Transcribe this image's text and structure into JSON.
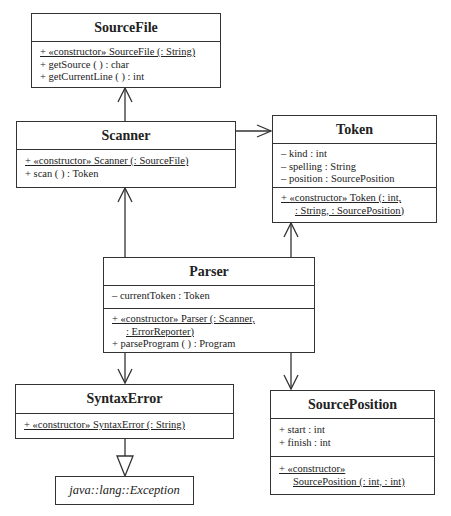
{
  "diagram": {
    "type": "UML class diagram",
    "classes": {
      "sourcefile": {
        "name": "SourceFile",
        "attributes": [],
        "operations": [
          {
            "text": "+ «constructor» SourceFile (: String)",
            "static_underline": true
          },
          {
            "text": "+ getSource ( ) : char",
            "static_underline": false
          },
          {
            "text": "+ getCurrentLine ( ) : int",
            "static_underline": false
          }
        ]
      },
      "scanner": {
        "name": "Scanner",
        "attributes": [],
        "operations": [
          {
            "text": "+ «constructor» Scanner (: SourceFile)",
            "static_underline": true
          },
          {
            "text": "+ scan ( ) : Token",
            "static_underline": false
          }
        ]
      },
      "token": {
        "name": "Token",
        "attributes": [
          {
            "text": "– kind : int"
          },
          {
            "text": "– spelling : String"
          },
          {
            "text": "– position : SourcePosition"
          }
        ],
        "operations": [
          {
            "line1": "+ «constructor» Token (: int,",
            "line2": ": String, : SourcePosition)",
            "static_underline": true
          }
        ]
      },
      "parser": {
        "name": "Parser",
        "attributes": [
          {
            "text": "– currentToken : Token"
          }
        ],
        "operations": [
          {
            "line1": "+ «constructor» Parser (: Scanner,",
            "line2": ": ErrorReporter)",
            "static_underline": true
          },
          {
            "text": "+ parseProgram ( ) : Program",
            "static_underline": false
          }
        ]
      },
      "syntaxerror": {
        "name": "SyntaxError",
        "attributes": [],
        "operations": [
          {
            "text": "+ «constructor» SyntaxError (: String)",
            "static_underline": true
          }
        ]
      },
      "exception": {
        "name": "java::lang::Exception",
        "abstract_italic": true
      },
      "sourceposition": {
        "name": "SourcePosition",
        "attributes": [
          {
            "text": "+ start : int"
          },
          {
            "text": "+ finish : int"
          }
        ],
        "operations": [
          {
            "line1": "+ «constructor»",
            "line2": "SourcePosition (: int, : int)",
            "static_underline": true
          }
        ]
      }
    },
    "relationships": [
      {
        "from": "Scanner",
        "to": "SourceFile",
        "kind": "navigable association"
      },
      {
        "from": "Scanner",
        "to": "Token",
        "kind": "navigable association"
      },
      {
        "from": "Parser",
        "to": "Scanner",
        "kind": "navigable association"
      },
      {
        "from": "Parser",
        "to": "Token",
        "kind": "navigable association"
      },
      {
        "from": "Parser",
        "to": "SyntaxError",
        "kind": "navigable association"
      },
      {
        "from": "Parser",
        "to": "SourcePosition",
        "kind": "navigable association"
      },
      {
        "from": "SyntaxError",
        "to": "java::lang::Exception",
        "kind": "generalization"
      }
    ],
    "colors": {
      "line": "#333333",
      "background": "#ffffff",
      "text": "#222222"
    }
  }
}
